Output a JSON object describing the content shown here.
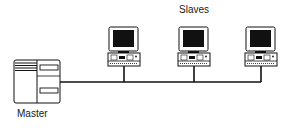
{
  "diagram": {
    "type": "master-slave network topology",
    "labels": {
      "master": "Master",
      "slaves": "Slaves"
    },
    "nodes": [
      {
        "id": "master",
        "kind": "server-tower",
        "label": "Master"
      },
      {
        "id": "slave-1",
        "kind": "desktop-computer"
      },
      {
        "id": "slave-2",
        "kind": "desktop-computer"
      },
      {
        "id": "slave-3",
        "kind": "desktop-computer"
      }
    ],
    "edges": [
      {
        "from": "master",
        "to": "bus"
      },
      {
        "from": "slave-1",
        "to": "bus"
      },
      {
        "from": "slave-2",
        "to": "bus"
      },
      {
        "from": "slave-3",
        "to": "bus"
      }
    ],
    "colors": {
      "line": "#111111",
      "screen": "#111111",
      "background": "#ffffff"
    }
  }
}
